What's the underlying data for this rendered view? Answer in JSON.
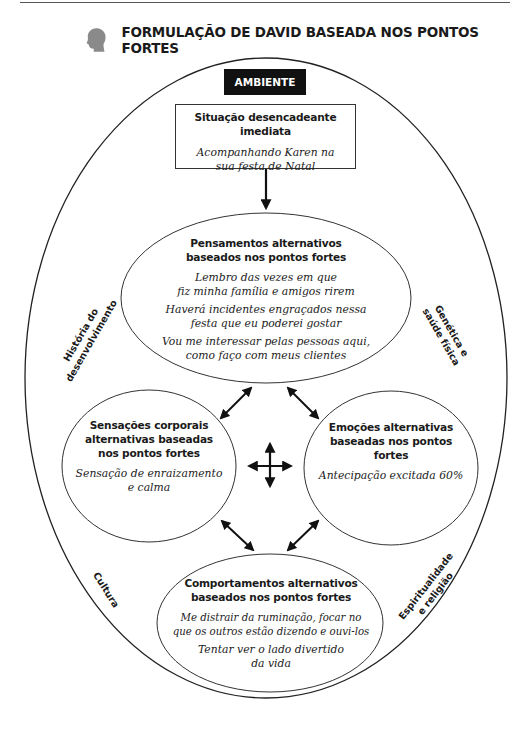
{
  "header": {
    "title": "FORMULAÇÃO DE DAVID BASEADA NOS PONTOS FORTES",
    "icon": "head-silhouette-icon",
    "icon_color": "#8a8a8a"
  },
  "diagram": {
    "environment_label": "AMBIENTE",
    "outer_factors": {
      "top_left": [
        "História do",
        "desenvolvimento"
      ],
      "top_right": [
        "Genética e",
        "saúde física"
      ],
      "bottom_left": [
        "Cultura"
      ],
      "bottom_right": [
        "Espiritualidade",
        "e religião"
      ]
    },
    "trigger": {
      "heading": "Situação desencadeante imediata",
      "text": [
        "Acompanhando Karen na",
        "sua festa de Natal"
      ]
    },
    "thoughts": {
      "heading": [
        "Pensamentos alternativos",
        "baseados nos pontos fortes"
      ],
      "items": [
        [
          "Lembro das vezes em que",
          "fiz minha família e amigos rirem"
        ],
        [
          "Haverá incidentes engraçados nessa",
          "festa que eu poderei gostar"
        ],
        [
          "Vou me interessar pelas pessoas aqui,",
          "como faço com meus clientes"
        ]
      ]
    },
    "body_sensations": {
      "heading": [
        "Sensações corporais",
        "alternativas baseadas",
        "nos pontos fortes"
      ],
      "text": [
        "Sensação de enraizamento",
        "e calma"
      ]
    },
    "emotions": {
      "heading": [
        "Emoções alternativas",
        "baseadas nos pontos fortes"
      ],
      "text": [
        "Antecipação excitada 60%"
      ]
    },
    "behaviors": {
      "heading": [
        "Comportamentos alternativos",
        "baseados nos pontos fortes"
      ],
      "items": [
        [
          "Me distrair da ruminação, focar no",
          "que os outros estão dizendo e ouvi-los"
        ],
        [
          "Tentar ver o lado divertido",
          "da vida"
        ]
      ]
    },
    "center_icon": "four-way-arrow-icon"
  }
}
